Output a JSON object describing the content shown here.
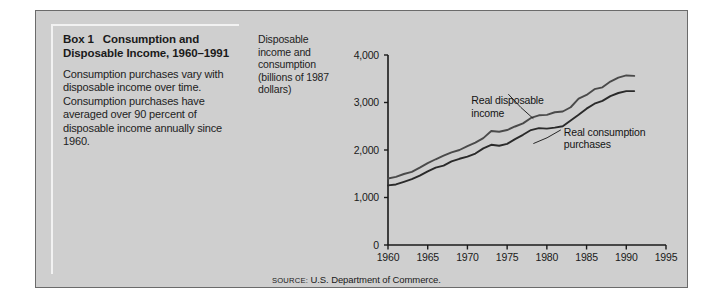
{
  "figure": {
    "background_color": "#cfcfcf",
    "border_color": "#6b6b6b",
    "page_color": "#ffffff"
  },
  "box": {
    "title_number": "Box 1",
    "title_text": "Consumption and Disposable Income, 1960–1991",
    "body": "Consumption purchases vary with disposable income over time. Consumption purchases have averaged over 90 percent of disposable income annually since 1960."
  },
  "axis_caption": "Disposable income and consumption (billions of 1987 dollars)",
  "source": {
    "label": "SOURCE:",
    "text": "U.S. Department of Commerce."
  },
  "chart_data": {
    "type": "line",
    "xlabel": "",
    "ylabel": "Disposable income and consumption (billions of 1987 dollars)",
    "xlim": [
      1960,
      1995
    ],
    "ylim": [
      0,
      4000
    ],
    "xticks": [
      1960,
      1965,
      1970,
      1975,
      1980,
      1985,
      1990,
      1995
    ],
    "xtick_labels": [
      "1960",
      "1965",
      "1970",
      "1975",
      "1980",
      "1985",
      "1990",
      "1995"
    ],
    "yticks": [
      0,
      1000,
      2000,
      3000,
      4000
    ],
    "ytick_labels": [
      "0",
      "1,000",
      "2,000",
      "3,000",
      "4,000"
    ],
    "grid": false,
    "legend": "annotations",
    "annotations": [
      {
        "text": "Real disposable income",
        "series": "Real disposable income",
        "x": 1972.5,
        "y": 3050
      },
      {
        "text": "Real consumption purchases",
        "series": "Real consumption purchases",
        "x": 1981.5,
        "y": 2380
      }
    ],
    "x": [
      1960,
      1961,
      1962,
      1963,
      1964,
      1965,
      1966,
      1967,
      1968,
      1969,
      1970,
      1971,
      1972,
      1973,
      1974,
      1975,
      1976,
      1977,
      1978,
      1979,
      1980,
      1981,
      1982,
      1983,
      1984,
      1985,
      1986,
      1987,
      1988,
      1989,
      1990,
      1991
    ],
    "series": [
      {
        "name": "Real disposable income",
        "color": "#4a4a4a",
        "values": [
          1400,
          1435,
          1495,
          1540,
          1630,
          1725,
          1805,
          1880,
          1950,
          2000,
          2080,
          2155,
          2250,
          2400,
          2385,
          2420,
          2495,
          2560,
          2675,
          2730,
          2740,
          2795,
          2810,
          2900,
          3080,
          3160,
          3280,
          3320,
          3440,
          3525,
          3570,
          3560
        ],
        "style": "solid"
      },
      {
        "name": "Real consumption purchases",
        "color": "#2a2a2a",
        "values": [
          1255,
          1275,
          1330,
          1385,
          1460,
          1550,
          1630,
          1670,
          1760,
          1815,
          1860,
          1925,
          2035,
          2110,
          2090,
          2130,
          2230,
          2320,
          2420,
          2460,
          2450,
          2470,
          2500,
          2620,
          2740,
          2870,
          2975,
          3035,
          3135,
          3200,
          3240,
          3240
        ],
        "style": "solid"
      }
    ]
  }
}
